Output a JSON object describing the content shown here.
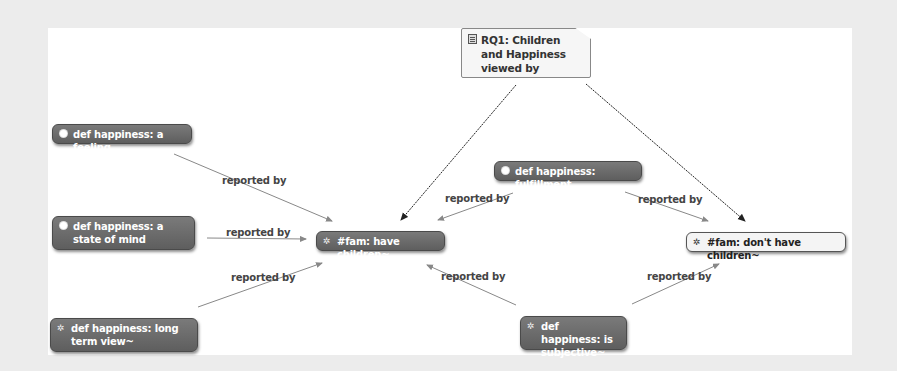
{
  "diagram": {
    "colors": {
      "background": "#ececec",
      "canvas": "#ffffff",
      "code_node": "#6b6b6b",
      "edge_grey": "#888888",
      "edge_black": "#222222"
    },
    "nodes": [
      {
        "id": "rq1",
        "type": "memo",
        "icon": "memo-icon",
        "label": "RQ1: Children and Happiness viewed by parents and non-parents"
      },
      {
        "id": "feeling",
        "type": "code",
        "icon": "code-dot-icon",
        "label": "def happiness: a feeling"
      },
      {
        "id": "state",
        "type": "code",
        "icon": "code-dot-icon",
        "label": "def happiness: a state of mind"
      },
      {
        "id": "longterm",
        "type": "code",
        "icon": "network-icon",
        "label": "def happiness: long term view~"
      },
      {
        "id": "have",
        "type": "code",
        "icon": "network-icon",
        "label": "#fam: have children~"
      },
      {
        "id": "fulfillment",
        "type": "code",
        "icon": "code-dot-icon",
        "label": "def happiness: fulfillment"
      },
      {
        "id": "dont",
        "type": "code-light",
        "icon": "network-icon",
        "label": "#fam: don't have children~"
      },
      {
        "id": "subjective",
        "type": "code",
        "icon": "network-icon",
        "label": "def happiness: is subjective~"
      }
    ],
    "edges": [
      {
        "from": "feeling",
        "to": "have",
        "label": "reported by"
      },
      {
        "from": "state",
        "to": "have",
        "label": "reported by"
      },
      {
        "from": "longterm",
        "to": "have",
        "label": "reported by"
      },
      {
        "from": "fulfillment",
        "to": "have",
        "label": "reported by"
      },
      {
        "from": "fulfillment",
        "to": "dont",
        "label": "reported by"
      },
      {
        "from": "subjective",
        "to": "have",
        "label": "reported by"
      },
      {
        "from": "subjective",
        "to": "dont",
        "label": "reported by"
      },
      {
        "from": "rq1",
        "to": "have",
        "label": ""
      },
      {
        "from": "rq1",
        "to": "dont",
        "label": ""
      }
    ]
  }
}
